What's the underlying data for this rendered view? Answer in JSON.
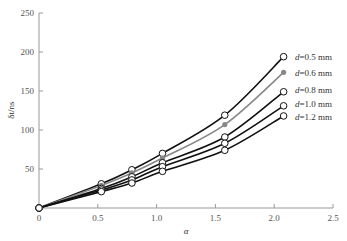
{
  "chart_data": {
    "type": "line",
    "title": "",
    "xlabel": "α",
    "ylabel": "δt/ns",
    "xlim": [
      0,
      2.5
    ],
    "ylim": [
      0,
      250
    ],
    "xticks": [
      "0",
      "0.5",
      "1.0",
      "1.5",
      "2.0",
      "2.5"
    ],
    "yticks": [
      "50",
      "100",
      "150",
      "200",
      "250"
    ],
    "grid": false,
    "legend_position": "inline-right",
    "x": [
      0,
      0.53,
      0.79,
      1.05,
      1.58,
      2.08
    ],
    "series": [
      {
        "name": "d=0.5 mm",
        "values": [
          0,
          31,
          49,
          70,
          119,
          194
        ],
        "color": "#111111",
        "marker": "open-circle"
      },
      {
        "name": "d=0.6 mm",
        "values": [
          0,
          29,
          45,
          64,
          107,
          174
        ],
        "color": "#888888",
        "marker": "filled-circle"
      },
      {
        "name": "d=0.8 mm",
        "values": [
          0,
          25,
          40,
          58,
          91,
          149
        ],
        "color": "#111111",
        "marker": "open-circle"
      },
      {
        "name": "d=1.0 mm",
        "values": [
          0,
          23,
          36,
          53,
          83,
          131
        ],
        "color": "#111111",
        "marker": "open-circle"
      },
      {
        "name": "d=1.2 mm",
        "values": [
          0,
          21,
          32,
          47,
          74,
          118
        ],
        "color": "#111111",
        "marker": "open-circle"
      }
    ]
  }
}
